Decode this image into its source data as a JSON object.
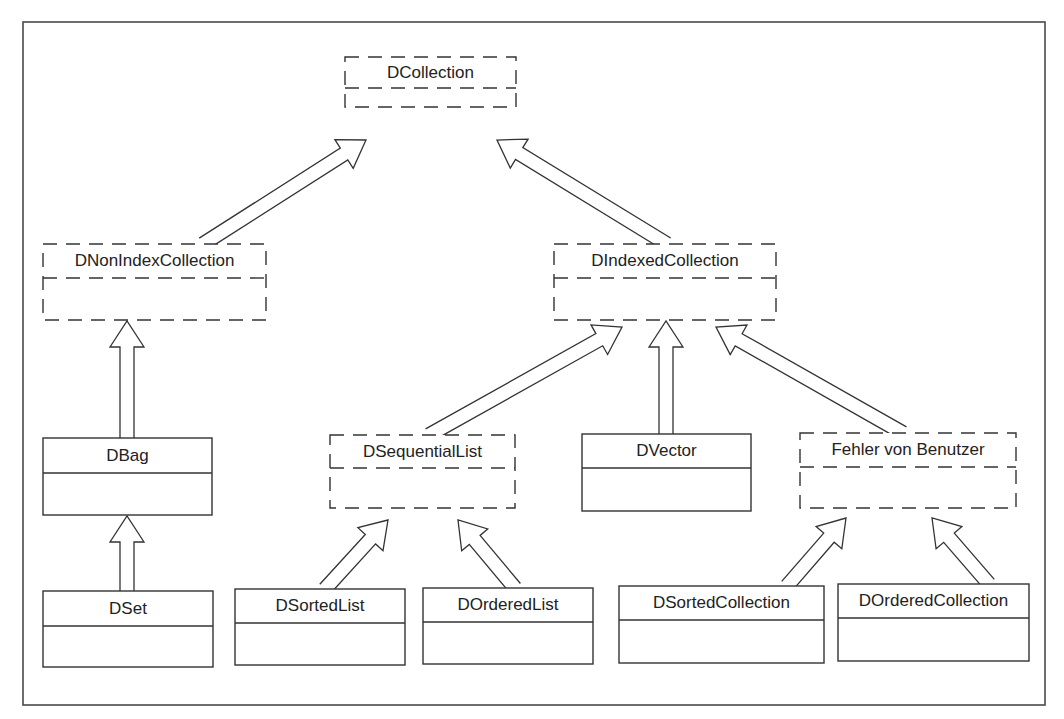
{
  "diagram": {
    "type": "uml-class-hierarchy",
    "frame": {
      "x": 23,
      "y": 22,
      "w": 1022,
      "h": 683
    },
    "colors": {
      "line": "#333333",
      "text": "#222222",
      "background": "#ffffff"
    },
    "classes": [
      {
        "id": "dcollection",
        "name": "DCollection",
        "style": "dashed",
        "x": 345,
        "y": 57,
        "w": 171,
        "h": 50,
        "divider": 88
      },
      {
        "id": "dnonindexcollection",
        "name": "DNonIndexCollection",
        "style": "dashed",
        "x": 43,
        "y": 244,
        "w": 223,
        "h": 76,
        "divider": 278
      },
      {
        "id": "dindexedcollection",
        "name": "DIndexedCollection",
        "style": "dashed",
        "x": 554,
        "y": 244,
        "w": 222,
        "h": 76,
        "divider": 278
      },
      {
        "id": "dbag",
        "name": "DBag",
        "style": "solid",
        "x": 43,
        "y": 438,
        "w": 169,
        "h": 77,
        "divider": 473
      },
      {
        "id": "dsequentiallist",
        "name": "DSequentialList",
        "style": "dashed",
        "x": 330,
        "y": 435,
        "w": 185,
        "h": 73,
        "divider": 468
      },
      {
        "id": "dvector",
        "name": "DVector",
        "style": "solid",
        "x": 582,
        "y": 434,
        "w": 169,
        "h": 77,
        "divider": 468
      },
      {
        "id": "fehlervonbenutzer",
        "name": "Fehler von Benutzer",
        "style": "dashed",
        "x": 800,
        "y": 433,
        "w": 216,
        "h": 75,
        "divider": 467
      },
      {
        "id": "dset",
        "name": "DSet",
        "style": "solid",
        "x": 43,
        "y": 591,
        "w": 170,
        "h": 76,
        "divider": 626
      },
      {
        "id": "dsortedlist",
        "name": "DSortedList",
        "style": "solid",
        "x": 235,
        "y": 589,
        "w": 170,
        "h": 76,
        "divider": 623
      },
      {
        "id": "dorderedlist",
        "name": "DOrderedList",
        "style": "solid",
        "x": 423,
        "y": 588,
        "w": 170,
        "h": 76,
        "divider": 622
      },
      {
        "id": "dsortedcollection",
        "name": "DSortedCollection",
        "style": "solid",
        "x": 619,
        "y": 586,
        "w": 205,
        "h": 77,
        "divider": 620
      },
      {
        "id": "dorderedcollection",
        "name": "DOrderedCollection",
        "style": "solid",
        "x": 838,
        "y": 584,
        "w": 191,
        "h": 77,
        "divider": 618
      }
    ],
    "generalizations": [
      {
        "from": "DNonIndexCollection",
        "to": "DCollection",
        "tail": [
          203,
          244
        ],
        "head": [
          366,
          140
        ]
      },
      {
        "from": "DIndexedCollection",
        "to": "DCollection",
        "tail": [
          667,
          244
        ],
        "head": [
          497,
          140
        ]
      },
      {
        "from": "DBag",
        "to": "DNonIndexCollection",
        "tail": [
          127,
          438
        ],
        "head": [
          127,
          321
        ]
      },
      {
        "from": "DSet",
        "to": "DBag",
        "tail": [
          127,
          591
        ],
        "head": [
          127,
          516
        ]
      },
      {
        "from": "DSequentialList",
        "to": "DIndexedCollection",
        "tail": [
          429,
          435
        ],
        "head": [
          622,
          327
        ]
      },
      {
        "from": "DVector",
        "to": "DIndexedCollection",
        "tail": [
          666,
          434
        ],
        "head": [
          666,
          321
        ]
      },
      {
        "from": "Fehler von Benutzer",
        "to": "DIndexedCollection",
        "tail": [
          903,
          433
        ],
        "head": [
          716,
          327
        ]
      },
      {
        "from": "DSortedList",
        "to": "DSequentialList",
        "tail": [
          325,
          589
        ],
        "head": [
          388,
          520
        ]
      },
      {
        "from": "DOrderedList",
        "to": "DSequentialList",
        "tail": [
          515,
          588
        ],
        "head": [
          458,
          520
        ]
      },
      {
        "from": "DSortedCollection",
        "to": "Fehler von Benutzer",
        "tail": [
          787,
          586
        ],
        "head": [
          846,
          518
        ]
      },
      {
        "from": "DOrderedCollection",
        "to": "Fehler von Benutzer",
        "tail": [
          989,
          584
        ],
        "head": [
          932,
          518
        ]
      }
    ]
  }
}
